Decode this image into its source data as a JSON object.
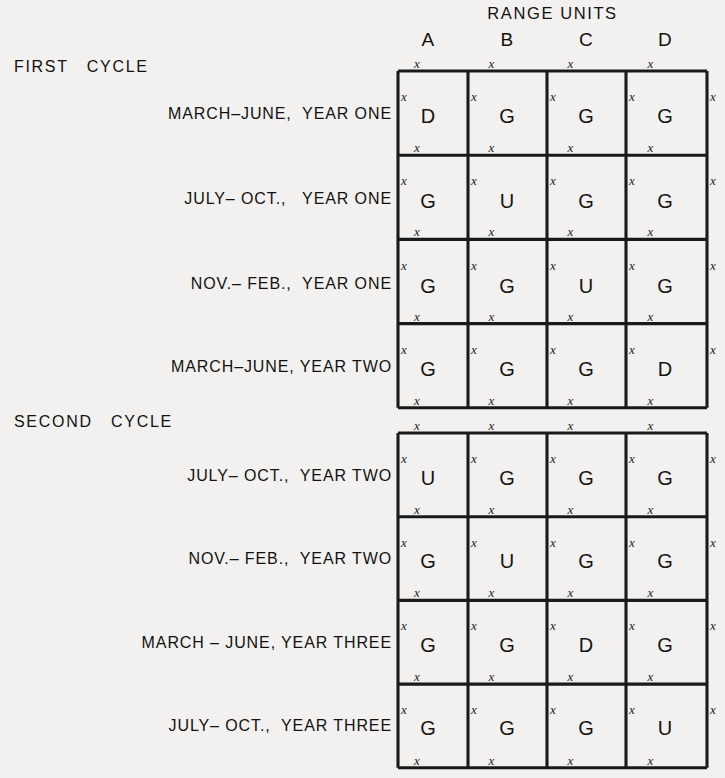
{
  "chart_data": {
    "type": "table",
    "title": "RANGE UNITS",
    "xlabel": "",
    "ylabel": "",
    "categories": [
      "A",
      "B",
      "C",
      "D"
    ],
    "legend": [],
    "grid": true,
    "sections": [
      {
        "header": "FIRST   CYCLE",
        "rows": [
          {
            "label": "MARCH–JUNE,  YEAR ONE",
            "values": [
              "D",
              "G",
              "G",
              "G"
            ]
          },
          {
            "label": "JULY– OCT.,   YEAR ONE",
            "values": [
              "G",
              "U",
              "G",
              "G"
            ]
          },
          {
            "label": "NOV.– FEB.,  YEAR ONE",
            "values": [
              "G",
              "G",
              "U",
              "G"
            ]
          },
          {
            "label": "MARCH–JUNE, YEAR TWO",
            "values": [
              "G",
              "G",
              "G",
              "D"
            ]
          }
        ]
      },
      {
        "header": "SECOND   CYCLE",
        "rows": [
          {
            "label": "JULY– OCT.,  YEAR TWO",
            "values": [
              "U",
              "G",
              "G",
              "G"
            ]
          },
          {
            "label": "NOV.– FEB.,  YEAR TWO",
            "values": [
              "G",
              "U",
              "G",
              "G"
            ]
          },
          {
            "label": "MARCH – JUNE, YEAR THREE",
            "values": [
              "G",
              "G",
              "D",
              "G"
            ]
          },
          {
            "label": "JULY– OCT.,  YEAR THREE",
            "values": [
              "G",
              "G",
              "G",
              "U"
            ]
          }
        ]
      }
    ],
    "tick_glyph": "x",
    "value_codes": [
      "D",
      "G",
      "U"
    ],
    "colors": {
      "background": "#f2f1ef",
      "ink": "#1a1a1a",
      "text": "#111111"
    }
  }
}
